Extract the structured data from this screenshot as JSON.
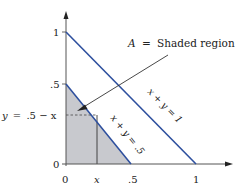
{
  "diagram": {
    "type": "region-plot",
    "axes": {
      "x_ticks": [
        {
          "value": 0,
          "label": "0"
        },
        {
          "value": "x",
          "label": "x"
        },
        {
          "value": 0.5,
          "label": ".5"
        },
        {
          "value": 1,
          "label": "1"
        }
      ],
      "y_ticks": [
        {
          "value": 0,
          "label": "0"
        },
        {
          "value": 0.5,
          "label": ".5"
        },
        {
          "value": 1,
          "label": "1"
        }
      ]
    },
    "lines": [
      {
        "equation": "x + y = 1",
        "label": "x + y = 1",
        "color": "#2d4f9e"
      },
      {
        "equation": "x + y = .5",
        "label": "x + y = .5",
        "color": "#2d4f9e"
      }
    ],
    "shaded_region": {
      "description": "triangle under x + y = .5",
      "fill": "#c8c9ce",
      "callout": {
        "var": "A",
        "equals": "=",
        "text": "Shaded region"
      }
    },
    "guide": {
      "label_left": "y = .5 − x",
      "label_var_y": "y",
      "label_eq": "=",
      "label_expr": ".5 − x"
    }
  }
}
